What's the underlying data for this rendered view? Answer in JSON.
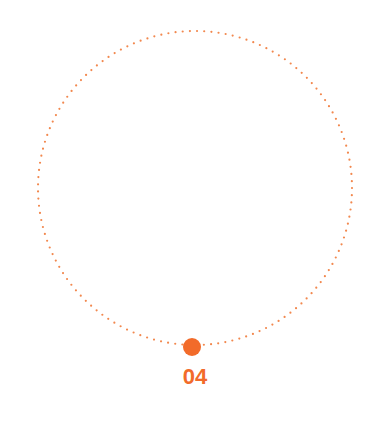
{
  "diagram": {
    "type": "circular-progress-marker",
    "accent_color": "#F26B2A",
    "marker": {
      "label": "04",
      "position": "bottom"
    }
  }
}
